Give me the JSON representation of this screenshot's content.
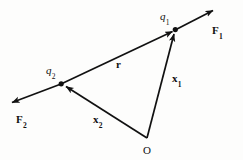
{
  "figure": {
    "background_color": "#fdfdfc",
    "stroke_color": "#111111"
  },
  "labels": {
    "q1": {
      "base": "q",
      "sub": "1"
    },
    "q2": {
      "base": "q",
      "sub": "2"
    },
    "F1": {
      "base": "F",
      "sub": "1"
    },
    "F2": {
      "base": "F",
      "sub": "2"
    },
    "x1": {
      "base": "x",
      "sub": "1"
    },
    "x2": {
      "base": "x",
      "sub": "2"
    },
    "r": {
      "base": "r",
      "sub": ""
    },
    "O": {
      "base": "O",
      "sub": ""
    }
  },
  "diagram_data": {
    "type": "vector-diagram",
    "points": {
      "origin": {
        "name": "O",
        "x": 147,
        "y": 138
      },
      "charge1": {
        "name": "q1",
        "x": 175,
        "y": 30
      },
      "charge2": {
        "name": "q2",
        "x": 61,
        "y": 84
      }
    },
    "vectors": [
      {
        "name": "x1",
        "from": "origin",
        "to": "charge1",
        "arrow": "to",
        "style": "solid"
      },
      {
        "name": "x2",
        "from": "origin",
        "to": "charge2",
        "arrow": "to",
        "style": "solid"
      },
      {
        "name": "r",
        "from": "charge2",
        "to": "charge1",
        "arrow": "to",
        "style": "solid"
      },
      {
        "name": "F1",
        "from": "charge1",
        "to": {
          "x": 216,
          "y": 8
        },
        "arrow": "to",
        "style": "solid"
      },
      {
        "name": "F2",
        "from": "charge2",
        "to": {
          "x": 9,
          "y": 104
        },
        "arrow": "to",
        "style": "solid"
      }
    ]
  }
}
